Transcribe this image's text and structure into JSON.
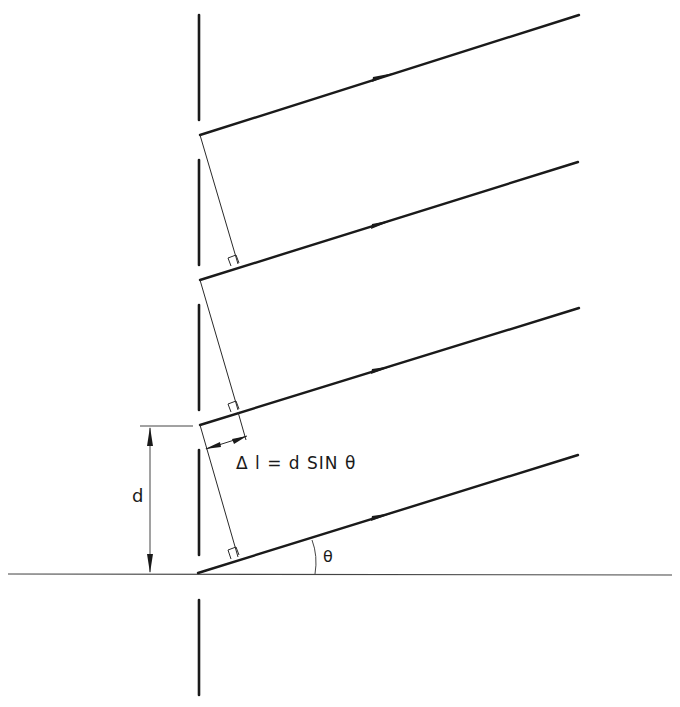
{
  "diagram": {
    "labels": {
      "spacing": "d",
      "path_difference": "Δ l  =  d  SIN  θ",
      "angle": "θ"
    },
    "colors": {
      "ink": "#1a1a1a",
      "thin_line": "#2a2a2a",
      "background": "#ffffff"
    },
    "grating": {
      "x": 199,
      "slit_segments": [
        {
          "y1": 15,
          "y2": 120
        },
        {
          "y1": 160,
          "y2": 265
        },
        {
          "y1": 305,
          "y2": 410
        },
        {
          "y1": 450,
          "y2": 555
        },
        {
          "y1": 600,
          "y2": 695
        }
      ]
    },
    "rays": [
      {
        "x1": 199,
        "y1": 135,
        "x2": 579,
        "y2": 15
      },
      {
        "x1": 199,
        "y1": 280,
        "x2": 578,
        "y2": 162
      },
      {
        "x1": 199,
        "y1": 425,
        "x2": 579,
        "y2": 308
      },
      {
        "x1": 199,
        "y1": 573,
        "x2": 578,
        "y2": 455
      }
    ],
    "baseline": {
      "x1": 8,
      "x2": 672,
      "y": 574
    }
  }
}
